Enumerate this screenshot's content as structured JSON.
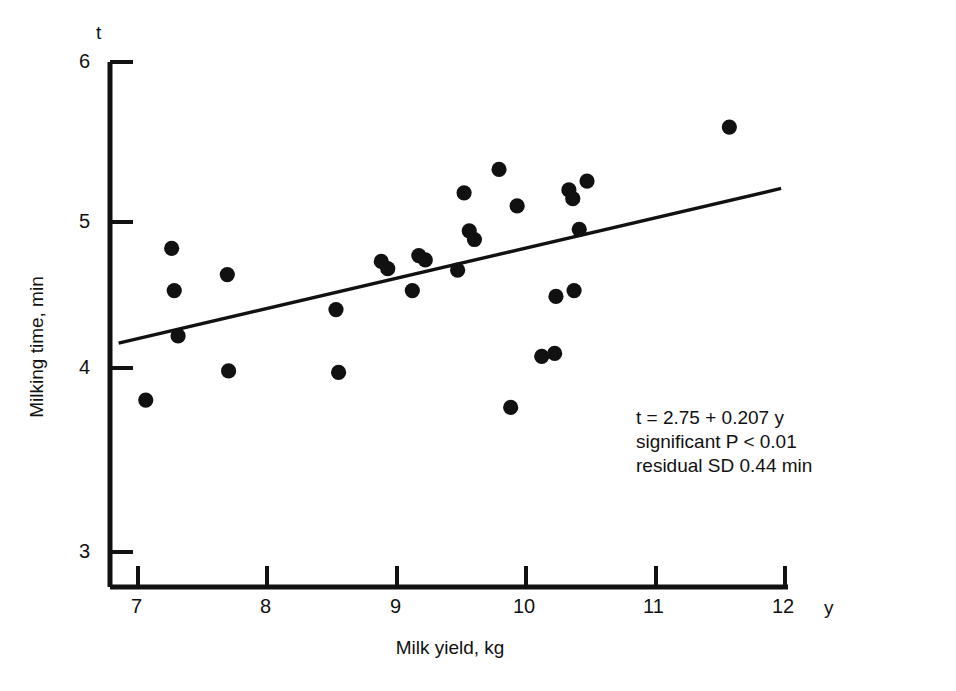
{
  "figure": {
    "y_axis_title": "Milking time, min",
    "x_axis_title": "Milk yield, kg",
    "y_var_symbol": "t",
    "x_var_symbol": "y"
  },
  "annotation": {
    "line1": "t = 2.75 + 0.207 y",
    "line2": "significant P  <  0.01",
    "line3": "residual SD 0.44 min"
  },
  "chart_data": {
    "type": "scatter",
    "title": "",
    "xlabel": "Milk yield, kg",
    "ylabel": "Milking time, min",
    "x_symbol": "y",
    "y_symbol": "t",
    "xlim": [
      6.77,
      12.0
    ],
    "ylim": [
      2.83,
      6.0
    ],
    "xticks": [
      7,
      8,
      9,
      10,
      11,
      12
    ],
    "yticks": [
      3,
      4,
      5,
      6
    ],
    "xtick_labels": [
      "7",
      "8",
      "9",
      "10",
      "11",
      "12"
    ],
    "ytick_labels": [
      "3",
      "4",
      "5",
      "6"
    ],
    "grid": false,
    "legend": false,
    "marker": "filled-circle",
    "marker_color": "#111111",
    "points": [
      {
        "x": 7.06,
        "y": 3.78
      },
      {
        "x": 7.26,
        "y": 4.82
      },
      {
        "x": 7.28,
        "y": 4.53
      },
      {
        "x": 7.31,
        "y": 4.22
      },
      {
        "x": 7.69,
        "y": 4.64
      },
      {
        "x": 7.7,
        "y": 3.98
      },
      {
        "x": 8.53,
        "y": 4.4
      },
      {
        "x": 8.55,
        "y": 3.97
      },
      {
        "x": 8.88,
        "y": 4.73
      },
      {
        "x": 8.93,
        "y": 4.68
      },
      {
        "x": 9.12,
        "y": 4.53
      },
      {
        "x": 9.17,
        "y": 4.77
      },
      {
        "x": 9.22,
        "y": 4.74
      },
      {
        "x": 9.47,
        "y": 4.67
      },
      {
        "x": 9.52,
        "y": 5.2
      },
      {
        "x": 9.56,
        "y": 4.94
      },
      {
        "x": 9.6,
        "y": 4.88
      },
      {
        "x": 9.79,
        "y": 5.36
      },
      {
        "x": 9.88,
        "y": 3.73
      },
      {
        "x": 9.93,
        "y": 5.11
      },
      {
        "x": 10.12,
        "y": 4.08
      },
      {
        "x": 10.22,
        "y": 4.1
      },
      {
        "x": 10.23,
        "y": 4.49
      },
      {
        "x": 10.37,
        "y": 4.53
      },
      {
        "x": 10.33,
        "y": 5.22
      },
      {
        "x": 10.36,
        "y": 5.16
      },
      {
        "x": 10.41,
        "y": 4.95
      },
      {
        "x": 10.47,
        "y": 5.28
      },
      {
        "x": 11.57,
        "y": 5.65
      }
    ],
    "fit_line": {
      "label": "t = 2.75 + 0.207 y",
      "intercept": 2.75,
      "slope": 0.207,
      "x_start": 6.85,
      "x_end": 11.97,
      "y_start": 4.17,
      "y_end": 5.23
    }
  }
}
